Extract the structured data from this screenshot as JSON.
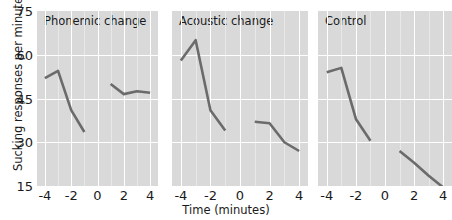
{
  "axes": {
    "ylabel": "Sucking responses per minute",
    "xlabel": "Time (minutes)",
    "yticks": [
      "75",
      "60",
      "45",
      "30",
      "15"
    ],
    "ytick_values": [
      75,
      60,
      45,
      30,
      15
    ],
    "xticks": [
      "-4",
      "-2",
      "0",
      "2",
      "4"
    ],
    "xtick_values": [
      -4,
      -2,
      0,
      2,
      4
    ]
  },
  "panel_titles": {
    "p0": "Phonemic change",
    "p1": "Acoustic change",
    "p2": "Control"
  },
  "style": {
    "panel_background": "#d9d9d9",
    "grid_color": "#ffffff",
    "line_color": "#6b6b6b",
    "text_color": "#1a1a1a",
    "figure_background": "#ffffff"
  },
  "chart_data": {
    "type": "line",
    "title": "",
    "xlabel": "Time (minutes)",
    "ylabel": "Sucking responses per minute",
    "xlim": [
      -4.6,
      4.6
    ],
    "ylim": [
      15,
      75
    ],
    "grid": true,
    "legend": "none",
    "annotations": [
      {
        "type": "vline",
        "x": 0,
        "style": "dashed",
        "color": "#ffffff",
        "note": "stimulus change point"
      }
    ],
    "panels": [
      {
        "title": "Phonemic change",
        "series": [
          {
            "name": "pre-change",
            "x": [
              -4,
              -3,
              -2,
              -1
            ],
            "values": [
              52.0,
              54.5,
              41.0,
              33.5
            ]
          },
          {
            "name": "post-change",
            "x": [
              1,
              2,
              3,
              4
            ],
            "values": [
              50.0,
              46.5,
              47.5,
              47.0
            ]
          }
        ]
      },
      {
        "title": "Acoustic change",
        "series": [
          {
            "name": "pre-change",
            "x": [
              -4,
              -3,
              -2,
              -1
            ],
            "values": [
              58.0,
              65.0,
              41.0,
              34.0
            ]
          },
          {
            "name": "post-change",
            "x": [
              1,
              2,
              3,
              4
            ],
            "values": [
              37.0,
              36.5,
              30.0,
              27.0
            ]
          }
        ]
      },
      {
        "title": "Control",
        "series": [
          {
            "name": "pre-change",
            "x": [
              -4,
              -3,
              -2,
              -1
            ],
            "values": [
              54.0,
              55.5,
              38.0,
              30.5
            ]
          },
          {
            "name": "post-change",
            "x": [
              1,
              2,
              3,
              4
            ],
            "values": [
              27.0,
              23.0,
              18.5,
              14.5
            ]
          }
        ]
      }
    ]
  }
}
